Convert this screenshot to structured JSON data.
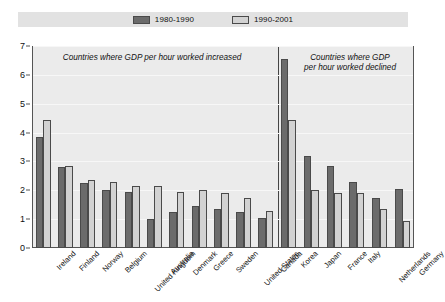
{
  "legend": {
    "entries": [
      {
        "label": "1980-1990",
        "color": "#6b6b6b"
      },
      {
        "label": "1990-2001",
        "color": "#d2d2d2"
      }
    ]
  },
  "annotations": {
    "left_panel": "Countries where GDP per hour worked increased",
    "right_panel": "Countries where GDP\nper hour worked declined"
  },
  "axis": {
    "yticks": [
      "0",
      "1",
      "2",
      "3",
      "4",
      "5",
      "6",
      "7"
    ]
  },
  "colors": {
    "series_1980_1990": "#6b6b6b",
    "series_1990_2001": "#d2d2d2",
    "plot_background": "#ebebeb",
    "legend_background": "#e2e2e2",
    "frame": "#555555"
  },
  "chart_data": {
    "type": "bar",
    "title": "",
    "xlabel": "",
    "ylabel": "",
    "ylim": [
      0,
      7
    ],
    "ytick_step": 1,
    "grid": true,
    "legend_position": "top-center",
    "categories": [
      "Ireland",
      "Finland",
      "Norway",
      "Belgium",
      "United Kingdom",
      "Australia",
      "Denmark",
      "Greece",
      "Sweden",
      "United States",
      "Canada",
      "Korea",
      "Japan",
      "France",
      "Italy",
      "Netherlands",
      "Germany"
    ],
    "panels": [
      {
        "label": "Countries where GDP per hour worked increased",
        "categories": [
          "Ireland",
          "Finland",
          "Norway",
          "Belgium",
          "United Kingdom",
          "Australia",
          "Denmark",
          "Greece",
          "Sweden",
          "United States",
          "Canada"
        ]
      },
      {
        "label": "Countries where GDP per hour worked declined",
        "categories": [
          "Korea",
          "Japan",
          "France",
          "Italy",
          "Netherlands",
          "Germany"
        ]
      }
    ],
    "series": [
      {
        "name": "1980-1990",
        "values": [
          3.85,
          2.8,
          2.25,
          2.0,
          1.95,
          1.0,
          1.25,
          1.45,
          1.35,
          1.25,
          1.05,
          6.55,
          3.2,
          2.85,
          2.3,
          1.75,
          2.05
        ]
      },
      {
        "name": "1990-2001",
        "values": [
          4.45,
          2.85,
          2.35,
          2.3,
          2.15,
          2.15,
          1.95,
          2.0,
          1.9,
          1.75,
          1.3,
          4.45,
          2.0,
          1.9,
          1.9,
          1.35,
          0.95
        ]
      }
    ]
  }
}
